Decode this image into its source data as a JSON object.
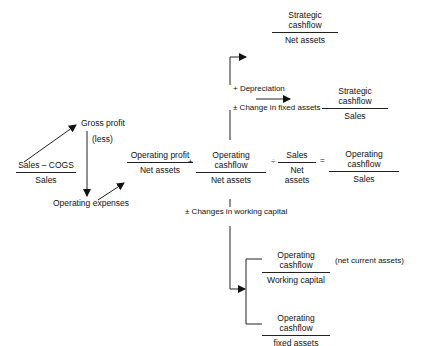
{
  "diagram": {
    "gross_margin": {
      "numerator": "Sales – COGS",
      "denominator": "Sales"
    },
    "gross_profit_label": "Gross profit",
    "less_label": "(less)",
    "operating_expenses_label": "Operating expenses",
    "main_equation": {
      "term1": {
        "numerator": "Operating profit",
        "denominator": "Net assets"
      },
      "op1": "+",
      "term2": {
        "numerator": "Operating cashflow",
        "denominator": "Net assets"
      },
      "op2": "÷",
      "term3": {
        "numerator": "Sales",
        "denominator": "Net assets"
      },
      "op3": "=",
      "result": {
        "numerator": "Operating cashflow",
        "denominator": "Sales"
      }
    },
    "depreciation_label": "+ Depreciation",
    "fixed_assets_change_label": "± Change in fixed assets",
    "strategic_net_assets": {
      "numerator": "Strategic cashflow",
      "denominator": "Net assets"
    },
    "strategic_sales": {
      "numerator": "Strategic cashflow",
      "denominator": "Sales"
    },
    "working_capital_change_label": "± Changes in working capital",
    "ocf_working_capital": {
      "numerator": "Operating cashflow",
      "denominator": "Working capital"
    },
    "net_current_assets_note": "(net current assets)",
    "ocf_fixed_assets": {
      "numerator": "Operating cashflow",
      "denominator": "fixed assets"
    }
  }
}
